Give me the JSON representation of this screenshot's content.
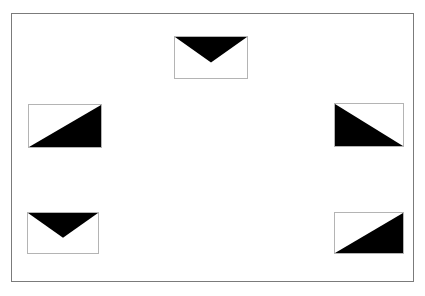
{
  "figure": {
    "kind": "geometric-pattern-figure",
    "background_color": "#ffffff",
    "frame": {
      "name": "outer-border-frame",
      "stroke_color": "#7b7b7b",
      "stroke_width": 1,
      "x": 11,
      "y": 13,
      "width": 403,
      "height": 269
    },
    "tile_defaults": {
      "fill_color": "#000000",
      "outline_color": "#b4b4b4",
      "outline_width": 1
    },
    "tiles": [
      {
        "id": "top-center",
        "position_label": "top-center",
        "x": 174,
        "y": 36,
        "width": 74,
        "height": 43,
        "shading": "downward-pointing-triangle",
        "triangle_points": "0,0 100,0 50,62",
        "fill_color": "#000000",
        "outline_color": "#b4b4b4"
      },
      {
        "id": "middle-left",
        "position_label": "middle-left",
        "x": 28,
        "y": 104,
        "width": 74,
        "height": 44,
        "shading": "lower-right-triangle",
        "triangle_points": "100,0 100,100 0,100",
        "fill_color": "#000000",
        "outline_color": "#b4b4b4"
      },
      {
        "id": "middle-right",
        "position_label": "middle-right",
        "x": 334,
        "y": 103,
        "width": 70,
        "height": 44,
        "shading": "lower-left-triangle",
        "triangle_points": "0,0 100,100 0,100",
        "fill_color": "#000000",
        "outline_color": "#b4b4b4"
      },
      {
        "id": "bottom-left",
        "position_label": "bottom-left",
        "x": 27,
        "y": 212,
        "width": 72,
        "height": 42,
        "shading": "downward-pointing-triangle",
        "triangle_points": "0,0 100,0 50,62",
        "fill_color": "#000000",
        "outline_color": "#b4b4b4"
      },
      {
        "id": "bottom-right",
        "position_label": "bottom-right",
        "x": 334,
        "y": 212,
        "width": 70,
        "height": 42,
        "shading": "lower-right-triangle",
        "triangle_points": "100,0 100,100 0,100",
        "fill_color": "#000000",
        "outline_color": "#b4b4b4"
      }
    ]
  }
}
